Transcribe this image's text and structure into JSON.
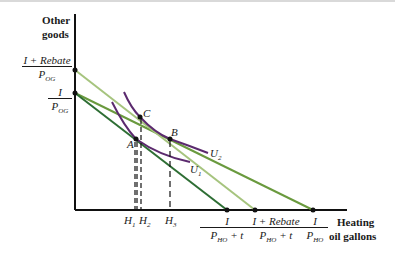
{
  "axes": {
    "y_label_line1": "Other",
    "y_label_line2": "goods",
    "x_label_line1": "Heating",
    "x_label_line2": "oil gallons"
  },
  "y_intercepts": {
    "rebate": {
      "num": "I + Rebate",
      "den_main": "P",
      "den_sub": "OG"
    },
    "income": {
      "num": "I",
      "den_main": "P",
      "den_sub": "OG"
    }
  },
  "x_intercepts": {
    "taxed": {
      "num": "I",
      "den_main": "P",
      "den_sub": "HO",
      "den_suffix": " + t"
    },
    "rebate": {
      "num": "I + Rebate",
      "den_main": "P",
      "den_sub": "HO",
      "den_suffix": " + t"
    },
    "original": {
      "num": "I",
      "den_main": "P",
      "den_sub": "HO",
      "den_suffix": ""
    }
  },
  "points": {
    "A": "A",
    "B": "B",
    "C": "C"
  },
  "curves": {
    "U1": {
      "main": "U",
      "sub": "1"
    },
    "U2": {
      "main": "U",
      "sub": "2"
    }
  },
  "quantities": {
    "H1": {
      "main": "H",
      "sub": "1"
    },
    "H2": {
      "main": "H",
      "sub": "2"
    },
    "H3": {
      "main": "H",
      "sub": "3"
    }
  },
  "colors": {
    "axis": "#111111",
    "budget_original": "#6a9a3e",
    "budget_taxed": "#2e6e34",
    "budget_rebate": "#a6c47e",
    "indifference": "#5b2a6e"
  }
}
